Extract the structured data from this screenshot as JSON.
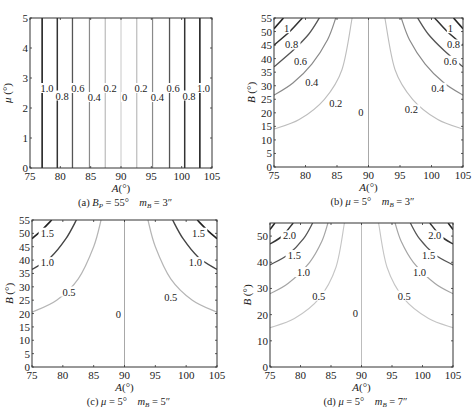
{
  "figure": {
    "top_clip_text": "…"
  },
  "chart_data": [
    {
      "id": "a",
      "type": "line",
      "title": "(a) B_P = 55°   m_B = 3″",
      "caption": {
        "prefix": "(a) ",
        "var1": "B",
        "sub1": "P",
        "eq1": " = 55°",
        "var2": "m",
        "sub2": "B",
        "eq2": " = 3″"
      },
      "xlabel": "A(°)",
      "ylabel": "μ (°)",
      "xlim": [
        75,
        105
      ],
      "ylim": [
        0,
        5
      ],
      "xticks": [
        75,
        80,
        85,
        90,
        95,
        100,
        105
      ],
      "yticks": [
        0,
        1,
        2,
        3,
        4,
        5
      ],
      "grid": false,
      "box": {
        "x": 30,
        "y": 18,
        "w": 182,
        "h": 150
      },
      "contour_style": "vertical",
      "contours": [
        {
          "level": "1.0",
          "x": [
            77.0,
            103.0
          ],
          "color": "#222222",
          "width": 1.6
        },
        {
          "level": "0.8",
          "x": [
            79.5,
            100.5
          ],
          "color": "#333333",
          "width": 1.5
        },
        {
          "level": "0.6",
          "x": [
            82.0,
            98.0
          ],
          "color": "#555555",
          "width": 1.3
        },
        {
          "level": "0.4",
          "x": [
            84.8,
            95.2
          ],
          "color": "#8a8a8a",
          "width": 1.2
        },
        {
          "level": "0.2",
          "x": [
            87.4,
            92.6
          ],
          "color": "#b5b5b5",
          "width": 1.1
        },
        {
          "level": "0",
          "x": [
            90.0
          ],
          "color": "#c8c8c8",
          "width": 1.0
        }
      ],
      "labels": [
        {
          "t": "1.0",
          "x": 77.8,
          "y": 2.6
        },
        {
          "t": "0.8",
          "x": 80.3,
          "y": 2.35
        },
        {
          "t": "0.6",
          "x": 82.9,
          "y": 2.6
        },
        {
          "t": "0.4",
          "x": 85.6,
          "y": 2.3
        },
        {
          "t": "0.2",
          "x": 88.2,
          "y": 2.6
        },
        {
          "t": "0",
          "x": 90.6,
          "y": 2.3
        },
        {
          "t": "0.2",
          "x": 93.3,
          "y": 2.6
        },
        {
          "t": "0.4",
          "x": 96.0,
          "y": 2.3
        },
        {
          "t": "0.6",
          "x": 98.6,
          "y": 2.6
        },
        {
          "t": "0.8",
          "x": 101.2,
          "y": 2.35
        },
        {
          "t": "1.0",
          "x": 103.6,
          "y": 2.6
        }
      ]
    },
    {
      "id": "b",
      "type": "line",
      "title": "(b) μ = 5°   m_B = 3″",
      "caption": {
        "prefix": "(b) ",
        "var1": "μ",
        "sub1": "",
        "eq1": " = 5°",
        "var2": "m",
        "sub2": "B",
        "eq2": " = 3″"
      },
      "xlabel": "A(°)",
      "ylabel": "B (°)",
      "xlim": [
        75,
        105
      ],
      "ylim": [
        0,
        55
      ],
      "xticks": [
        75,
        80,
        85,
        90,
        95,
        100,
        105
      ],
      "yticks": [
        0,
        5,
        10,
        15,
        20,
        25,
        30,
        35,
        40,
        45,
        50,
        55
      ],
      "grid": false,
      "box": {
        "x": 274,
        "y": 18,
        "w": 189,
        "h": 149
      },
      "contour_style": "curve",
      "contours": [
        {
          "level": "1",
          "left": [
            [
              75,
              51
            ],
            [
              76.5,
              55
            ]
          ],
          "right": [
            [
              103.5,
              55
            ],
            [
              105,
              51
            ]
          ],
          "color": "#222222",
          "width": 1.6
        },
        {
          "level": "0.8",
          "left": [
            [
              75,
              45
            ],
            [
              77.5,
              50
            ],
            [
              79.5,
              55
            ]
          ],
          "right": [
            [
              100.5,
              55
            ],
            [
              102.5,
              50
            ],
            [
              105,
              45
            ]
          ],
          "color": "#333333",
          "width": 1.5
        },
        {
          "level": "0.6",
          "left": [
            [
              75,
              37
            ],
            [
              78,
              43
            ],
            [
              80.5,
              49
            ],
            [
              82.2,
              55
            ]
          ],
          "right": [
            [
              97.8,
              55
            ],
            [
              99.5,
              49
            ],
            [
              102,
              43
            ],
            [
              105,
              37
            ]
          ],
          "color": "#555555",
          "width": 1.3
        },
        {
          "level": "0.4",
          "left": [
            [
              75,
              26.5
            ],
            [
              78,
              31
            ],
            [
              81,
              38
            ],
            [
              83.5,
              47
            ],
            [
              84.8,
              55
            ]
          ],
          "right": [
            [
              95.2,
              55
            ],
            [
              96.5,
              47
            ],
            [
              99,
              38
            ],
            [
              102,
              31
            ],
            [
              105,
              26.5
            ]
          ],
          "color": "#8a8a8a",
          "width": 1.2
        },
        {
          "level": "0.2",
          "left": [
            [
              75,
              14
            ],
            [
              79,
              17.5
            ],
            [
              83,
              25
            ],
            [
              85.8,
              36
            ],
            [
              87.4,
              55
            ]
          ],
          "right": [
            [
              92.6,
              55
            ],
            [
              94.2,
              36
            ],
            [
              97,
              25
            ],
            [
              101,
              17.5
            ],
            [
              105,
              14
            ]
          ],
          "color": "#bdbdbd",
          "width": 1.1
        },
        {
          "level": "0",
          "left": [
            [
              90,
              0
            ],
            [
              90,
              55
            ]
          ],
          "right": [],
          "color": "#a8a8a8",
          "width": 1.0
        }
      ],
      "labels": [
        {
          "t": "1",
          "x": 77.0,
          "y": 50.5
        },
        {
          "t": "0.8",
          "x": 77.8,
          "y": 44.5
        },
        {
          "t": "0.6",
          "x": 79.2,
          "y": 38.5
        },
        {
          "t": "0.4",
          "x": 81.0,
          "y": 30.5
        },
        {
          "t": "0.2",
          "x": 84.8,
          "y": 23.0
        },
        {
          "t": "0",
          "x": 88.8,
          "y": 19.5
        },
        {
          "t": "0.2",
          "x": 96.8,
          "y": 20.5
        },
        {
          "t": "0.4",
          "x": 101.0,
          "y": 28.5
        },
        {
          "t": "0.6",
          "x": 103.0,
          "y": 38.5
        },
        {
          "t": "0.8",
          "x": 103.5,
          "y": 44.5
        },
        {
          "t": "1",
          "x": 103.0,
          "y": 50.5
        }
      ]
    },
    {
      "id": "c",
      "type": "line",
      "title": "(c) μ = 5°   m_B = 5″",
      "caption": {
        "prefix": "(c) ",
        "var1": "μ",
        "sub1": "",
        "eq1": " = 5°",
        "var2": "m",
        "sub2": "B",
        "eq2": " = 5″"
      },
      "xlabel": "A(°)",
      "ylabel": "B (°)",
      "xlim": [
        75,
        105
      ],
      "ylim": [
        0,
        55
      ],
      "xticks": [
        75,
        80,
        85,
        90,
        95,
        100,
        105
      ],
      "yticks": [
        0,
        5,
        10,
        15,
        20,
        25,
        30,
        35,
        40,
        45,
        50,
        55
      ],
      "grid": false,
      "box": {
        "x": 32,
        "y": 220,
        "w": 185,
        "h": 147
      },
      "contour_style": "curve",
      "contours": [
        {
          "level": "1.5",
          "left": [
            [
              75,
              48
            ],
            [
              76.5,
              51
            ],
            [
              78.2,
              55
            ]
          ],
          "right": [
            [
              101.8,
              55
            ],
            [
              103.5,
              51
            ],
            [
              105,
              48
            ]
          ],
          "color": "#222222",
          "width": 1.6
        },
        {
          "level": "1.0",
          "left": [
            [
              75,
              36.5
            ],
            [
              78,
              41
            ],
            [
              80.5,
              48
            ],
            [
              82.2,
              55
            ]
          ],
          "right": [
            [
              97.8,
              55
            ],
            [
              99.5,
              48
            ],
            [
              102,
              41
            ],
            [
              105,
              36.5
            ]
          ],
          "color": "#444444",
          "width": 1.4
        },
        {
          "level": "0.5",
          "left": [
            [
              75,
              20.5
            ],
            [
              79,
              25
            ],
            [
              82.5,
              33
            ],
            [
              85,
              45
            ],
            [
              86.2,
              55
            ]
          ],
          "right": [
            [
              93.8,
              55
            ],
            [
              95,
              45
            ],
            [
              97.5,
              33
            ],
            [
              101,
              25
            ],
            [
              105,
              20.5
            ]
          ],
          "color": "#b5b5b5",
          "width": 1.2
        },
        {
          "level": "0",
          "left": [
            [
              90,
              0
            ],
            [
              90,
              55
            ]
          ],
          "right": [],
          "color": "#a8a8a8",
          "width": 1.0
        }
      ],
      "labels": [
        {
          "t": "1.5",
          "x": 77.5,
          "y": 49.5
        },
        {
          "t": "1.0",
          "x": 77.5,
          "y": 38.5
        },
        {
          "t": "0.5",
          "x": 81.0,
          "y": 27.5
        },
        {
          "t": "0",
          "x": 89.0,
          "y": 19.0
        },
        {
          "t": "0.5",
          "x": 97.5,
          "y": 25.5
        },
        {
          "t": "1.0",
          "x": 101.5,
          "y": 38.5
        },
        {
          "t": "1.5",
          "x": 102.0,
          "y": 49.5
        }
      ]
    },
    {
      "id": "d",
      "type": "line",
      "title": "(d) μ = 5°   m_B = 7″",
      "caption": {
        "prefix": "(d) ",
        "var1": "μ",
        "sub1": "",
        "eq1": " = 5°",
        "var2": "m",
        "sub2": "B",
        "eq2": " = 7″"
      },
      "xlabel": "A(°)",
      "ylabel": "B (°)",
      "xlim": [
        75,
        105
      ],
      "ylim": [
        0,
        55
      ],
      "xticks": [
        75,
        80,
        85,
        90,
        95,
        100,
        105
      ],
      "yticks": [
        0,
        10,
        20,
        30,
        40,
        50
      ],
      "grid": false,
      "box": {
        "x": 270,
        "y": 223,
        "w": 183,
        "h": 144
      },
      "contour_style": "curve",
      "contours": [
        {
          "level": "2.5",
          "left": [
            [
              75,
              52.5
            ],
            [
              75.8,
              55
            ]
          ],
          "right": [
            [
              104.2,
              55
            ],
            [
              105,
              52.5
            ]
          ],
          "color": "#222222",
          "width": 1.5
        },
        {
          "level": "2.0",
          "left": [
            [
              75,
              47
            ],
            [
              77,
              50
            ],
            [
              78.8,
              55
            ]
          ],
          "right": [
            [
              101.2,
              55
            ],
            [
              103,
              50
            ],
            [
              105,
              47
            ]
          ],
          "color": "#333333",
          "width": 1.5
        },
        {
          "level": "1.5",
          "left": [
            [
              75,
              39
            ],
            [
              78,
              43
            ],
            [
              80.5,
              49
            ],
            [
              82,
              55
            ]
          ],
          "right": [
            [
              98,
              55
            ],
            [
              99.5,
              49
            ],
            [
              102,
              43
            ],
            [
              105,
              39
            ]
          ],
          "color": "#555555",
          "width": 1.3
        },
        {
          "level": "1.0",
          "left": [
            [
              75,
              28
            ],
            [
              78,
              32
            ],
            [
              81.5,
              40
            ],
            [
              83.5,
              48
            ],
            [
              84.5,
              55
            ]
          ],
          "right": [
            [
              95.5,
              55
            ],
            [
              96.5,
              48
            ],
            [
              98.5,
              40
            ],
            [
              102,
              32
            ],
            [
              105,
              28
            ]
          ],
          "color": "#a5a5a5",
          "width": 1.2
        },
        {
          "level": "0.5",
          "left": [
            [
              75,
              15
            ],
            [
              79,
              18.5
            ],
            [
              83,
              26
            ],
            [
              85.8,
              38
            ],
            [
              87.2,
              55
            ]
          ],
          "right": [
            [
              92.8,
              55
            ],
            [
              94.2,
              38
            ],
            [
              97,
              26
            ],
            [
              101,
              18.5
            ],
            [
              105,
              15
            ]
          ],
          "color": "#c5c5c5",
          "width": 1.1
        },
        {
          "level": "0",
          "left": [
            [
              90,
              0
            ],
            [
              90,
              55
            ]
          ],
          "right": [],
          "color": "#bdbdbd",
          "width": 1.0
        }
      ],
      "labels": [
        {
          "t": "2.0",
          "x": 78.2,
          "y": 49.5
        },
        {
          "t": "1.5",
          "x": 79.0,
          "y": 42.0
        },
        {
          "t": "1.0",
          "x": 80.5,
          "y": 35.5
        },
        {
          "t": "0.5",
          "x": 83.0,
          "y": 26.5
        },
        {
          "t": "0",
          "x": 89.0,
          "y": 20.0
        },
        {
          "t": "0.5",
          "x": 97.0,
          "y": 26.5
        },
        {
          "t": "1.0",
          "x": 99.5,
          "y": 35.5
        },
        {
          "t": "1.5",
          "x": 101.0,
          "y": 42.0
        },
        {
          "t": "2.0",
          "x": 102.0,
          "y": 49.5
        }
      ]
    }
  ]
}
